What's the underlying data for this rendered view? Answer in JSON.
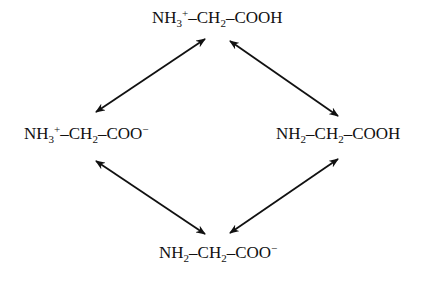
{
  "diagram": {
    "type": "equilibrium-square",
    "nodes": {
      "top": {
        "label": "NH3+–CH2–COOH",
        "parts": [
          {
            "t": "NH"
          },
          {
            "sub": "3"
          },
          {
            "sup": "+"
          },
          {
            "t": "–CH"
          },
          {
            "sub": "2"
          },
          {
            "t": "–COOH"
          }
        ]
      },
      "left": {
        "label": "NH3+–CH2–COO−",
        "parts": [
          {
            "t": "NH"
          },
          {
            "sub": "3"
          },
          {
            "sup": "+"
          },
          {
            "t": "–CH"
          },
          {
            "sub": "2"
          },
          {
            "t": "–COO"
          },
          {
            "sup": "−"
          }
        ]
      },
      "right": {
        "label": "NH2–CH2–COOH",
        "parts": [
          {
            "t": "NH"
          },
          {
            "sub": "2"
          },
          {
            "t": "–CH"
          },
          {
            "sub": "2"
          },
          {
            "t": "–COOH"
          }
        ]
      },
      "bottom": {
        "label": "NH2–CH2–COO−",
        "parts": [
          {
            "t": "NH"
          },
          {
            "sub": "2"
          },
          {
            "t": "–CH"
          },
          {
            "sub": "2"
          },
          {
            "t": "–COO"
          },
          {
            "sup": "−"
          }
        ]
      }
    },
    "edges": [
      {
        "from": "left",
        "to": "top",
        "style": "double-headed-arrow"
      },
      {
        "from": "top",
        "to": "right",
        "style": "double-headed-arrow"
      },
      {
        "from": "left",
        "to": "bottom",
        "style": "double-headed-arrow"
      },
      {
        "from": "bottom",
        "to": "right",
        "style": "double-headed-arrow"
      }
    ],
    "colors": {
      "ink": "#111111",
      "background": "#ffffff"
    }
  }
}
